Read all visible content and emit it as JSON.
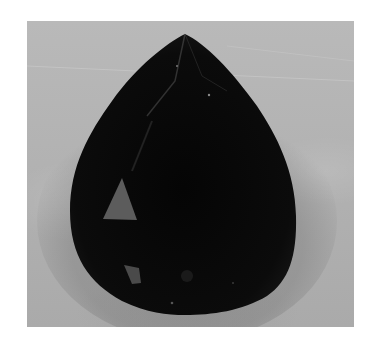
{
  "image": {
    "subject": "pear-shaped faceted dark gemstone",
    "description": "Photograph of a dark, pear (teardrop) cut gemstone on a light grey textured background",
    "colors": {
      "background_page": "#ffffff",
      "backdrop": "#b5b5b5",
      "gem_body": "#0a0a0a",
      "facet_highlight": "#5a5a5a"
    }
  }
}
